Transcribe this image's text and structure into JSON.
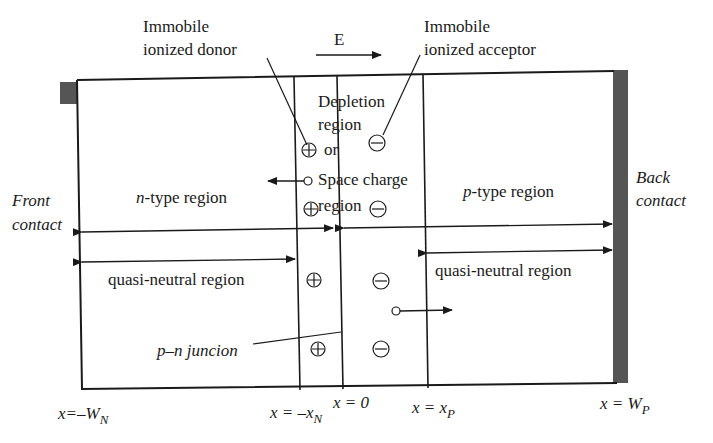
{
  "labels": {
    "donor_line1": "Immobile",
    "donor_line2": "ionized donor",
    "field": "E",
    "acceptor_line1": "Immobile",
    "acceptor_line2": "ionized acceptor",
    "depletion_1": "Depletion",
    "depletion_2": "region",
    "depletion_3": "or",
    "depletion_4": "Space charge",
    "depletion_5": "region",
    "front_1": "Front",
    "front_2": "contact",
    "back_1": "Back",
    "back_2": "contact",
    "n_prefix": "n",
    "n_rest": "-type region",
    "p_prefix": "p",
    "p_rest": "-type region",
    "qn_left": "quasi-neutral region",
    "qn_right": "quasi-neutral region",
    "junction": "p–n juncion"
  },
  "axis": {
    "x_wn_pre": "x=–W",
    "x_wn_sub": "N",
    "x_xn_pre": "x = –x",
    "x_xn_sub": "N",
    "x_zero": "x = 0",
    "x_xp_pre": "x = x",
    "x_xp_sub": "P",
    "x_wp_pre": "x = W",
    "x_wp_sub": "P"
  },
  "colors": {
    "line": "#1a1a1a",
    "contact": "#555555"
  }
}
